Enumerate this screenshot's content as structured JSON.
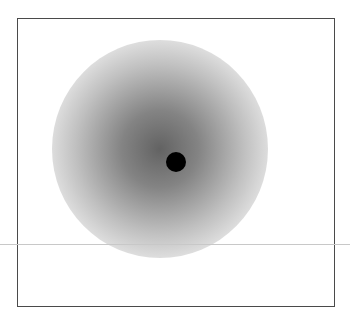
{
  "figure": {
    "frame": {
      "left": 17,
      "top": 18,
      "right": 335,
      "bottom": 307,
      "stroke": "#4a4a4a"
    },
    "blob": {
      "center_x": 176,
      "center_y": 149,
      "radius": 108,
      "color": "#5a5a5a"
    },
    "dot": {
      "center_x": 176,
      "center_y": 162,
      "radius": 10,
      "color": "#000000"
    },
    "horizontal_line": {
      "y": 244,
      "color": "#c8c8c8"
    }
  }
}
